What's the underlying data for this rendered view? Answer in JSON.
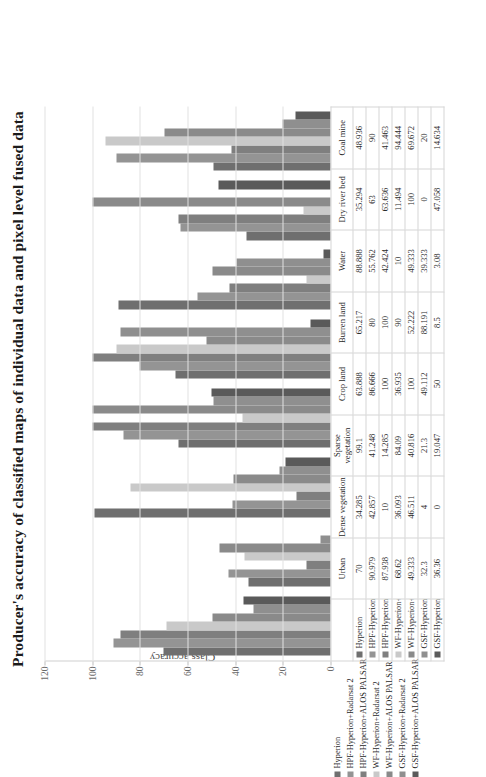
{
  "chart_data": {
    "type": "bar",
    "title": "Producer's accuracy of classified maps of individual data and pixel level fused data",
    "xlabel": "",
    "ylabel": "Class accuracy",
    "ylim": [
      0,
      120
    ],
    "yticks": [
      0,
      20,
      40,
      60,
      80,
      100,
      120
    ],
    "grid": true,
    "legend_position": "left-bottom",
    "orientation": "rotated-90",
    "categories": [
      "Urban",
      "Dense vegetation",
      "Sparse vegetation",
      "Crop land",
      "Burren land",
      "Water",
      "Dry river bed",
      "Coal mine"
    ],
    "series": [
      {
        "name": "Hyperion",
        "color": "#6f6f6f",
        "values": [
          70,
          34.285,
          99.1,
          63.888,
          65.217,
          88.888,
          35.294,
          48.936
        ]
      },
      {
        "name": "HPF-Hyperion+Radarsat 2",
        "color": "#949494",
        "values": [
          90.979,
          42.857,
          41.248,
          86.666,
          80,
          55.762,
          63,
          90
        ]
      },
      {
        "name": "HPF-Hyperion+ALOS PALSAR",
        "color": "#7f7f7f",
        "values": [
          87.938,
          10,
          14.285,
          100,
          100,
          42.424,
          63.636,
          41.463
        ]
      },
      {
        "name": "WF-Hyperion+Radarsat 2",
        "color": "#c9c9c9",
        "values": [
          68.62,
          36.093,
          84.09,
          36.935,
          90,
          10,
          11.494,
          94.444
        ]
      },
      {
        "name": "WF-Hyperion+ALOS PALSAR",
        "color": "#8a8a8a",
        "values": [
          49.333,
          46.511,
          40.816,
          100,
          52.222,
          49.333,
          100,
          69.672
        ]
      },
      {
        "name": "GSF-Hyperion+Radarsat 2",
        "color": "#8f8f8f",
        "values": [
          32.3,
          4,
          21.3,
          49.112,
          88.191,
          39.333,
          0,
          20
        ]
      },
      {
        "name": "GSF-Hyperion+ALOS PALSAR",
        "color": "#5a5a5a",
        "values": [
          36.36,
          0,
          19.047,
          50,
          8.5,
          3.08,
          47.058,
          14.634
        ]
      }
    ]
  },
  "table": {
    "columns": [
      "Urban",
      "Dense vegetation",
      "Sparse vegetation",
      "Crop land",
      "Burren land",
      "Water",
      "Dry river bed",
      "Coal mine"
    ],
    "rows": [
      {
        "label": "Hyperion",
        "color": "#6f6f6f",
        "cells": [
          "70",
          "34.285",
          "99.1",
          "63.888",
          "65.217",
          "88.888",
          "35.294",
          "48.936"
        ]
      },
      {
        "label": "HPF-Hyperion+Radarsat 2",
        "color": "#949494",
        "cells": [
          "90.979",
          "42.857",
          "41.248",
          "86.666",
          "80",
          "55.762",
          "63",
          "90"
        ]
      },
      {
        "label": "HPF-Hyperion+ALOS PALSAR",
        "color": "#7f7f7f",
        "cells": [
          "87.938",
          "10",
          "14.285",
          "100",
          "100",
          "42.424",
          "63.636",
          "41.463"
        ]
      },
      {
        "label": "WF-Hyperion+Radarsat 2",
        "color": "#c9c9c9",
        "cells": [
          "68.62",
          "36.093",
          "84.09",
          "36.935",
          "90",
          "10",
          "11.494",
          "94.444"
        ]
      },
      {
        "label": "WF-Hyperion+ALOS PALSAR",
        "color": "#8a8a8a",
        "cells": [
          "49.333",
          "46.511",
          "40.816",
          "100",
          "52.222",
          "49.333",
          "100",
          "69.672"
        ]
      },
      {
        "label": "GSF-Hyperion+Radarsat 2",
        "color": "#8f8f8f",
        "cells": [
          "32.3",
          "4",
          "21.3",
          "49.112",
          "88.191",
          "39.333",
          "0",
          "20"
        ]
      },
      {
        "label": "GSF-Hyperion+ALOS PALSAR",
        "color": "#5a5a5a",
        "cells": [
          "36.36",
          "0",
          "19.047",
          "50",
          "8.5",
          "3.08",
          "47.058",
          "14.634"
        ]
      }
    ]
  },
  "legend": {
    "items": [
      {
        "label": "Hyperion",
        "color": "#6f6f6f"
      },
      {
        "label": "HPF-Hyperion+Radarsat 2",
        "color": "#949494"
      },
      {
        "label": "HPF-Hyperion+ALOS PALSAR",
        "color": "#7f7f7f"
      },
      {
        "label": "WF-Hyperion+Radarsat 2",
        "color": "#c9c9c9"
      },
      {
        "label": "WF-Hyperion+ALOS PALSAR",
        "color": "#8a8a8a"
      },
      {
        "label": "GSF-Hyperion+Radarsat 2",
        "color": "#8f8f8f"
      },
      {
        "label": "GSF-Hyperion+ALOS PALSAR",
        "color": "#5a5a5a"
      }
    ]
  }
}
